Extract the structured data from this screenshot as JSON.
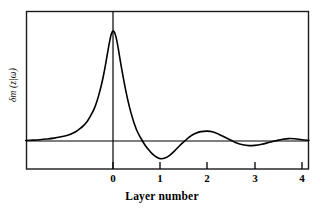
{
  "chart_data": {
    "type": "line",
    "title": "",
    "xlabel": "Layer number",
    "ylabel": "δm (z|ω)",
    "xlim": [
      -1.85,
      4.15
    ],
    "ylim": [
      -0.42,
      1.22
    ],
    "grid": false,
    "legend": null,
    "zero_line": 0,
    "zero_line_label": "0",
    "vertical_axis_at_x": 0,
    "xticks": [
      0,
      1,
      2,
      3,
      4
    ],
    "xtick_labels": [
      "0",
      "1",
      "2",
      "3",
      "4"
    ],
    "yticks": [],
    "ytick_labels": [],
    "series": [
      {
        "name": "δm (z|ω)",
        "color": "#000000",
        "line_width": 1.6,
        "x": [
          -1.85,
          -1.7,
          -1.55,
          -1.4,
          -1.25,
          -1.1,
          -1.0,
          -0.9,
          -0.8,
          -0.7,
          -0.62,
          -0.54,
          -0.47,
          -0.4,
          -0.34,
          -0.29,
          -0.24,
          -0.2,
          -0.16,
          -0.12,
          -0.08,
          -0.04,
          0.0,
          0.04,
          0.08,
          0.12,
          0.16,
          0.21,
          0.26,
          0.32,
          0.38,
          0.45,
          0.52,
          0.6,
          0.68,
          0.76,
          0.84,
          0.92,
          1.0,
          1.1,
          1.2,
          1.3,
          1.4,
          1.5,
          1.62,
          1.74,
          1.86,
          2.0,
          2.12,
          2.24,
          2.36,
          2.5,
          2.62,
          2.75,
          2.88,
          3.0,
          3.15,
          3.3,
          3.45,
          3.6,
          3.72,
          3.85,
          4.0,
          4.15
        ],
        "y": [
          0.005,
          0.008,
          0.012,
          0.018,
          0.026,
          0.038,
          0.048,
          0.062,
          0.082,
          0.112,
          0.142,
          0.182,
          0.232,
          0.292,
          0.362,
          0.435,
          0.52,
          0.6,
          0.69,
          0.79,
          0.885,
          0.965,
          1.0,
          0.98,
          0.915,
          0.82,
          0.715,
          0.595,
          0.48,
          0.36,
          0.258,
          0.16,
          0.082,
          0.018,
          -0.038,
          -0.082,
          -0.12,
          -0.145,
          -0.16,
          -0.155,
          -0.13,
          -0.092,
          -0.048,
          -0.008,
          0.038,
          0.068,
          0.085,
          0.09,
          0.082,
          0.062,
          0.036,
          0.006,
          -0.018,
          -0.034,
          -0.042,
          -0.04,
          -0.03,
          -0.014,
          0.002,
          0.016,
          0.022,
          0.02,
          0.012,
          0.006
        ]
      }
    ],
    "annotations": [
      {
        "text": "main peak",
        "x": 0,
        "y": 1.0
      },
      {
        "text": "first trough",
        "x": 1.0,
        "y": -0.16
      },
      {
        "text": "second maximum",
        "x": 2.0,
        "y": 0.09
      },
      {
        "text": "second minimum",
        "x": 2.88,
        "y": -0.042
      },
      {
        "text": "third maximum",
        "x": 3.72,
        "y": 0.022
      }
    ]
  },
  "axes": {
    "x_axis_title": "Layer number",
    "y_axis_title": "δm (z|ω)",
    "tick_labels": [
      "0",
      "1",
      "2",
      "3",
      "4"
    ]
  },
  "colors": {
    "curve": "#000000",
    "frame": "#1a1a1a",
    "background": "#ffffff",
    "baseline": "#000000"
  }
}
